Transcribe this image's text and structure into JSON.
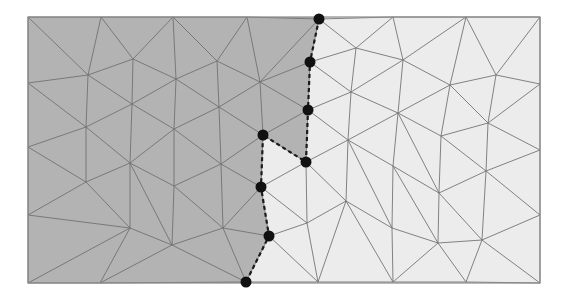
{
  "diagram": {
    "title": "Triangular mesh partitioned into two subdomains with interface nodes",
    "canvas": {
      "width": 567,
      "height": 301
    },
    "bounds": {
      "x0": 28,
      "y0": 17,
      "x1": 540,
      "y1": 283
    },
    "colors": {
      "left_region": "#b3b3b3",
      "right_region": "#ececec",
      "mesh_line": "#6e6e6e",
      "interface_line": "#1a1a1a",
      "node": "#111111",
      "border": "#8a8a8a"
    },
    "regions": [
      {
        "name": "left-subdomain",
        "label": "Subdomain 1"
      },
      {
        "name": "right-subdomain",
        "label": "Subdomain 2"
      }
    ],
    "interface_nodes": [
      [
        319,
        19
      ],
      [
        310,
        62
      ],
      [
        308,
        110
      ],
      [
        263,
        135
      ],
      [
        306,
        162
      ],
      [
        261,
        187
      ],
      [
        269,
        236
      ],
      [
        246,
        282
      ]
    ],
    "interface_path": [
      [
        319,
        19
      ],
      [
        310,
        62
      ],
      [
        308,
        110
      ],
      [
        306,
        162
      ],
      [
        263,
        135
      ],
      [
        261,
        187
      ],
      [
        269,
        236
      ],
      [
        246,
        282
      ]
    ],
    "vertices": [
      [
        28,
        17
      ],
      [
        101,
        17
      ],
      [
        173,
        17
      ],
      [
        247,
        17
      ],
      [
        319,
        19
      ],
      [
        393,
        17
      ],
      [
        466,
        17
      ],
      [
        540,
        17
      ],
      [
        28,
        83
      ],
      [
        88,
        75
      ],
      [
        133,
        59
      ],
      [
        176,
        79
      ],
      [
        217,
        61
      ],
      [
        260,
        82
      ],
      [
        310,
        62
      ],
      [
        356,
        48
      ],
      [
        403,
        60
      ],
      [
        450,
        85
      ],
      [
        496,
        75
      ],
      [
        540,
        84
      ],
      [
        28,
        147
      ],
      [
        86,
        127
      ],
      [
        132,
        104
      ],
      [
        174,
        129
      ],
      [
        219,
        107
      ],
      [
        263,
        135
      ],
      [
        308,
        110
      ],
      [
        351,
        92
      ],
      [
        398,
        113
      ],
      [
        441,
        136
      ],
      [
        488,
        123
      ],
      [
        540,
        150
      ],
      [
        28,
        215
      ],
      [
        86,
        182
      ],
      [
        130,
        163
      ],
      [
        174,
        186
      ],
      [
        221,
        164
      ],
      [
        261,
        187
      ],
      [
        306,
        162
      ],
      [
        348,
        140
      ],
      [
        393,
        166
      ],
      [
        439,
        193
      ],
      [
        486,
        171
      ],
      [
        540,
        215
      ],
      [
        28,
        283
      ],
      [
        100,
        283
      ],
      [
        130,
        228
      ],
      [
        172,
        245
      ],
      [
        223,
        228
      ],
      [
        269,
        236
      ],
      [
        307,
        223
      ],
      [
        346,
        201
      ],
      [
        392,
        228
      ],
      [
        438,
        243
      ],
      [
        482,
        240
      ],
      [
        540,
        283
      ],
      [
        246,
        282
      ],
      [
        318,
        282
      ],
      [
        393,
        282
      ],
      [
        466,
        282
      ]
    ],
    "edges_note": "Mesh connectivity rendered as triangle list below",
    "triangles": [
      [
        0,
        1,
        9
      ],
      [
        0,
        9,
        8
      ],
      [
        1,
        10,
        9
      ],
      [
        1,
        2,
        10
      ],
      [
        2,
        11,
        10
      ],
      [
        2,
        12,
        11
      ],
      [
        2,
        3,
        12
      ],
      [
        3,
        13,
        12
      ],
      [
        3,
        4,
        13
      ],
      [
        4,
        14,
        13
      ],
      [
        4,
        15,
        14
      ],
      [
        4,
        5,
        15
      ],
      [
        5,
        16,
        15
      ],
      [
        5,
        6,
        16
      ],
      [
        6,
        17,
        16
      ],
      [
        6,
        18,
        17
      ],
      [
        6,
        7,
        18
      ],
      [
        7,
        19,
        18
      ],
      [
        8,
        9,
        21
      ],
      [
        8,
        21,
        20
      ],
      [
        9,
        10,
        22
      ],
      [
        9,
        22,
        21
      ],
      [
        10,
        11,
        22
      ],
      [
        11,
        23,
        22
      ],
      [
        11,
        12,
        24
      ],
      [
        11,
        24,
        23
      ],
      [
        12,
        13,
        24
      ],
      [
        13,
        25,
        24
      ],
      [
        13,
        14,
        26
      ],
      [
        13,
        26,
        25
      ],
      [
        14,
        15,
        27
      ],
      [
        14,
        27,
        26
      ],
      [
        15,
        16,
        27
      ],
      [
        16,
        28,
        27
      ],
      [
        16,
        17,
        28
      ],
      [
        17,
        29,
        28
      ],
      [
        17,
        18,
        30
      ],
      [
        17,
        30,
        29
      ],
      [
        18,
        19,
        30
      ],
      [
        19,
        31,
        30
      ],
      [
        20,
        21,
        33
      ],
      [
        20,
        33,
        32
      ],
      [
        21,
        22,
        34
      ],
      [
        21,
        34,
        33
      ],
      [
        22,
        23,
        34
      ],
      [
        23,
        35,
        34
      ],
      [
        23,
        24,
        36
      ],
      [
        23,
        36,
        35
      ],
      [
        24,
        25,
        36
      ],
      [
        25,
        37,
        36
      ],
      [
        25,
        26,
        38
      ],
      [
        25,
        38,
        37
      ],
      [
        26,
        27,
        39
      ],
      [
        26,
        39,
        38
      ],
      [
        27,
        28,
        39
      ],
      [
        28,
        40,
        39
      ],
      [
        28,
        29,
        41
      ],
      [
        28,
        41,
        40
      ],
      [
        29,
        30,
        42
      ],
      [
        29,
        42,
        41
      ],
      [
        30,
        31,
        42
      ],
      [
        31,
        43,
        42
      ],
      [
        32,
        33,
        46
      ],
      [
        32,
        46,
        44
      ],
      [
        44,
        46,
        45
      ],
      [
        33,
        34,
        46
      ],
      [
        34,
        35,
        47
      ],
      [
        34,
        47,
        46
      ],
      [
        35,
        36,
        48
      ],
      [
        35,
        48,
        47
      ],
      [
        36,
        37,
        48
      ],
      [
        37,
        49,
        48
      ],
      [
        37,
        38,
        50
      ],
      [
        37,
        50,
        49
      ],
      [
        38,
        39,
        51
      ],
      [
        38,
        51,
        50
      ],
      [
        39,
        40,
        52
      ],
      [
        39,
        52,
        51
      ],
      [
        40,
        41,
        53
      ],
      [
        40,
        53,
        52
      ],
      [
        41,
        42,
        54
      ],
      [
        41,
        54,
        53
      ],
      [
        42,
        43,
        54
      ],
      [
        43,
        55,
        54
      ],
      [
        45,
        46,
        47
      ],
      [
        45,
        47,
        56
      ],
      [
        47,
        48,
        56
      ],
      [
        48,
        49,
        56
      ],
      [
        49,
        50,
        57
      ],
      [
        49,
        57,
        56
      ],
      [
        50,
        51,
        57
      ],
      [
        51,
        52,
        58
      ],
      [
        51,
        58,
        57
      ],
      [
        52,
        53,
        58
      ],
      [
        53,
        59,
        58
      ],
      [
        53,
        54,
        59
      ],
      [
        54,
        55,
        59
      ]
    ]
  }
}
